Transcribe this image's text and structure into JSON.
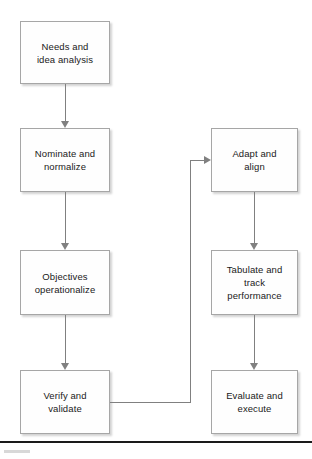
{
  "diagram": {
    "type": "flowchart",
    "background_color": "#ffffff",
    "node_fill": "#fefefe",
    "node_border_color": "#a6a6a6",
    "connector_color": "#808080",
    "text_color": "#1a1a1a",
    "nodes": [
      {
        "id": "needs",
        "label": "Needs and\nidea analysis",
        "x": 20,
        "y": 21,
        "w": 90,
        "h": 63,
        "column": "left"
      },
      {
        "id": "nominate",
        "label": "Nominate and\nnormalize",
        "x": 20,
        "y": 128,
        "w": 90,
        "h": 64,
        "column": "left"
      },
      {
        "id": "objectives",
        "label": "Objectives\noperationalize",
        "x": 20,
        "y": 250,
        "w": 90,
        "h": 65,
        "column": "left"
      },
      {
        "id": "verify",
        "label": "Verify and\nvalidate",
        "x": 20,
        "y": 370,
        "w": 90,
        "h": 64,
        "column": "left"
      },
      {
        "id": "adapt",
        "label": "Adapt and\nalign",
        "x": 211,
        "y": 128,
        "w": 87,
        "h": 64,
        "column": "right"
      },
      {
        "id": "tabulate",
        "label": "Tabulate and\ntrack\nperformance",
        "x": 211,
        "y": 250,
        "w": 87,
        "h": 65,
        "column": "right"
      },
      {
        "id": "evaluate",
        "label": "Evaluate and\nexecute",
        "x": 211,
        "y": 370,
        "w": 87,
        "h": 64,
        "column": "right"
      }
    ],
    "connectors": [
      {
        "id": "needs-to-nominate",
        "from": "needs",
        "to": "nominate",
        "kind": "vertical-arrow"
      },
      {
        "id": "nominate-to-objectives",
        "from": "nominate",
        "to": "objectives",
        "kind": "vertical-arrow"
      },
      {
        "id": "objectives-to-verify",
        "from": "objectives",
        "to": "verify",
        "kind": "vertical-arrow"
      },
      {
        "id": "verify-to-adapt",
        "from": "verify",
        "to": "adapt",
        "kind": "elbow-arrow"
      },
      {
        "id": "adapt-to-tabulate",
        "from": "adapt",
        "to": "tabulate",
        "kind": "vertical-arrow"
      },
      {
        "id": "tabulate-to-evaluate",
        "from": "tabulate",
        "to": "evaluate",
        "kind": "vertical-arrow"
      }
    ],
    "footer": {
      "rule_y": 441,
      "rule_color": "#1a1a1a"
    }
  }
}
